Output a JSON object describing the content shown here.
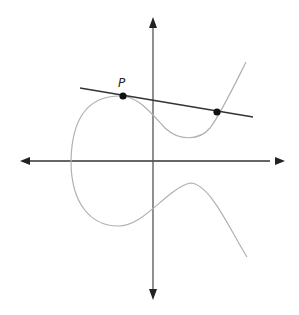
{
  "diagram": {
    "point_label": "P",
    "colors": {
      "axis": "#333333",
      "curve": "#aaaaaa",
      "line": "#333333",
      "point": "#111111"
    },
    "points": [
      {
        "name": "P",
        "x": 123,
        "y": 96
      },
      {
        "name": "intersection",
        "x": 217,
        "y": 112
      }
    ]
  }
}
